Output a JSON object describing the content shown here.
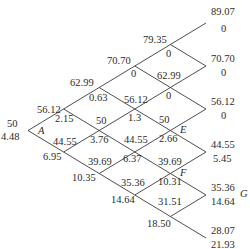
{
  "diagram": {
    "type": "binomial-tree",
    "steps": 5,
    "root": {
      "name": "A",
      "stock": "50",
      "option": "4.48"
    },
    "nodes": [
      {
        "id": "n1_1",
        "stock": "56.12",
        "option": "2.15"
      },
      {
        "id": "n1_0",
        "stock": "44.55",
        "option": "6.95"
      },
      {
        "id": "n2_2",
        "stock": "62.99",
        "option": "0.63"
      },
      {
        "id": "n2_1",
        "stock": "50",
        "option": "3.76"
      },
      {
        "id": "n2_0",
        "stock": "39.69",
        "option": "10.35"
      },
      {
        "id": "n3_3",
        "stock": "70.70",
        "option": "0"
      },
      {
        "id": "n3_2",
        "stock": "56.12",
        "option": "1.3"
      },
      {
        "id": "n3_1",
        "stock": "44.55",
        "option": "6.37"
      },
      {
        "id": "n3_0",
        "stock": "35.36",
        "option": "14.64"
      },
      {
        "id": "n4_4",
        "stock": "79.35",
        "option": "0"
      },
      {
        "id": "n4_3",
        "stock": "62.99",
        "option": "0"
      },
      {
        "id": "n4_2",
        "stock": "50",
        "option": "2.66",
        "name": "E"
      },
      {
        "id": "n4_1",
        "stock": "39.69",
        "option": "10.31",
        "name": "F"
      },
      {
        "id": "n4_0",
        "stock": "31.51",
        "option": "18.50"
      },
      {
        "id": "n5_5",
        "stock": "89.07",
        "option": "0"
      },
      {
        "id": "n5_4",
        "stock": "70.70",
        "option": "0"
      },
      {
        "id": "n5_3",
        "stock": "56.12",
        "option": "0"
      },
      {
        "id": "n5_2",
        "stock": "44.55",
        "option": "5.45"
      },
      {
        "id": "n5_1",
        "stock": "35.36",
        "option": "14.64",
        "name": "G"
      },
      {
        "id": "n5_0",
        "stock": "28.07",
        "option": "21.93"
      }
    ]
  }
}
